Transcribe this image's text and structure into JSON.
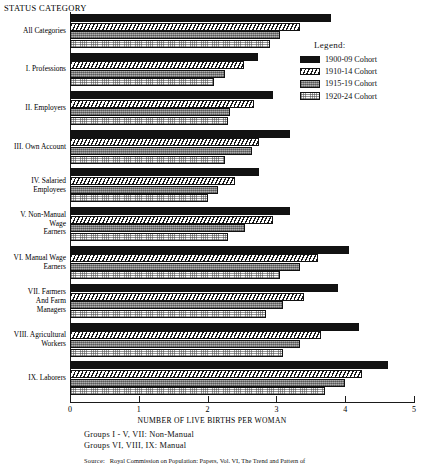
{
  "axis_title": "STATUS CATEGORY",
  "legend": {
    "title": "Legend:",
    "entries": [
      {
        "label": "1900-09 Cohort",
        "fill": "solid",
        "color": "#121212"
      },
      {
        "label": "1910-14 Cohort",
        "fill": "hatch",
        "color": "#1a1a1a"
      },
      {
        "label": "1915-19 Cohort",
        "fill": "gray",
        "color": "#8e8e8e"
      },
      {
        "label": "1920-24 Cohort",
        "fill": "dots",
        "color": "#fbfbfb"
      }
    ]
  },
  "footer": {
    "line1": "Groups I - V, VII: Non-Manual",
    "line2": "Groups VI, VIII, IX: Manual",
    "source_label": "Source:",
    "source_text": "Royal Commission on Population: Papers, Vol. VI, The Trend and Pattern of"
  },
  "chart_data": {
    "type": "bar",
    "orientation": "horizontal",
    "title": "",
    "xlabel": "NUMBER OF LIVE BIRTHS PER WOMAN",
    "ylabel": "STATUS CATEGORY",
    "xlim": [
      0,
      5
    ],
    "xticks": [
      0,
      1,
      2,
      3,
      4,
      5
    ],
    "grid": false,
    "legend_position": "top-right",
    "categories": [
      "All Categories",
      "I. Professions",
      "II. Employers",
      "III. Own Account",
      "IV. Salaried Employees",
      "V. Non-Manual Wage Earners",
      "VI. Manual Wage Earners",
      "VII. Farmers And Farm Managers",
      "VIII. Agricultural Workers",
      "IX. Laborers"
    ],
    "category_lines": [
      [
        "All Categories"
      ],
      [
        "I. Professions"
      ],
      [
        "II. Employers"
      ],
      [
        "III. Own Account"
      ],
      [
        "IV. Salaried",
        "Employees"
      ],
      [
        "V. Non-Manual",
        "Wage",
        "Earners"
      ],
      [
        "VI. Manual Wage",
        "Earners"
      ],
      [
        "VII. Farmers",
        "And Farm",
        "Managers"
      ],
      [
        "VIII. Agricultural",
        "Workers"
      ],
      [
        "IX. Laborers"
      ]
    ],
    "series": [
      {
        "name": "1900-09 Cohort",
        "fill": "solid",
        "values": [
          3.8,
          2.73,
          2.95,
          3.2,
          2.75,
          3.2,
          4.05,
          3.9,
          4.2,
          4.62
        ]
      },
      {
        "name": "1910-14 Cohort",
        "fill": "hatch",
        "values": [
          3.35,
          2.53,
          2.67,
          2.75,
          2.4,
          2.95,
          3.6,
          3.4,
          3.65,
          4.25
        ]
      },
      {
        "name": "1915-19 Cohort",
        "fill": "gray",
        "values": [
          3.05,
          2.25,
          2.33,
          2.65,
          2.15,
          2.55,
          3.35,
          3.1,
          3.35,
          4.0
        ]
      },
      {
        "name": "1920-24 Cohort",
        "fill": "dots",
        "values": [
          2.9,
          2.1,
          2.3,
          2.25,
          2.0,
          2.3,
          3.05,
          2.85,
          3.1,
          3.7
        ]
      }
    ]
  }
}
